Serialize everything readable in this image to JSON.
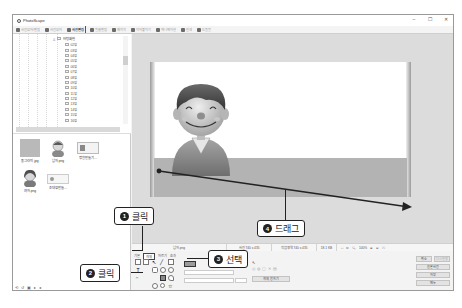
{
  "window": {
    "title": "PhotoScape",
    "controls": [
      "–",
      "☐",
      "✕"
    ]
  },
  "tabs": [
    {
      "label": "사진뷰어/편집",
      "active": false
    },
    {
      "label": "사진뷰어",
      "active": false
    },
    {
      "label": "사진편집",
      "active": true
    },
    {
      "label": "일괄편집",
      "active": false
    },
    {
      "label": "페이지",
      "active": false
    },
    {
      "label": "이어붙이기",
      "active": false
    },
    {
      "label": "애니메이션",
      "active": false
    },
    {
      "label": "인쇄",
      "active": false
    },
    {
      "label": "도움말",
      "active": false
    }
  ],
  "folder_tree": {
    "root": "바탕화면",
    "items": [
      "02장",
      "03장",
      "04장",
      "05장",
      "06장",
      "07장",
      "08장",
      "09장",
      "10장",
      "11장",
      "12장",
      "13장",
      "14장",
      "15장",
      "16장"
    ]
  },
  "thumbnails": [
    {
      "label": "동그라미.jpg",
      "kind": "gray"
    },
    {
      "label": "남자.png",
      "kind": "boy"
    },
    {
      "label": "명함만들기...",
      "kind": "card"
    },
    {
      "label": "여자.png",
      "kind": "girl"
    },
    {
      "label": "초대장만들...",
      "kind": "card2"
    }
  ],
  "left_footer_icons": [
    "⟲",
    "↺",
    "▣",
    "▸",
    "◂"
  ],
  "status": {
    "filename": "남자.png",
    "size": "사진 740 x 435",
    "edit_size": "작업영역 740 x 435",
    "file_size": "18.1 KB",
    "zoom": "100%"
  },
  "tools_panel": {
    "tabs": [
      "기본",
      "개체",
      "자르기",
      "효과"
    ],
    "active_tab": "개체",
    "apply_button": "개체 합치기",
    "right_buttons": [
      "취소",
      "다시실행",
      "원본 사진",
      "저장",
      "메뉴"
    ]
  },
  "annotations": [
    {
      "num": "1",
      "text": "클릭"
    },
    {
      "num": "2",
      "text": "클릭"
    },
    {
      "num": "3",
      "text": "선택"
    },
    {
      "num": "4",
      "text": "드래그"
    }
  ]
}
